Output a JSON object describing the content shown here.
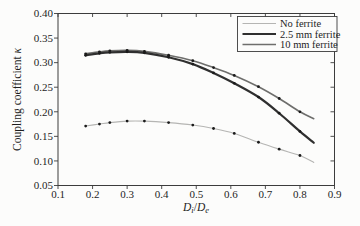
{
  "figure": {
    "background": "#fcfcfb",
    "axis_color": "#3c3c3c"
  },
  "chart_data": {
    "type": "line",
    "title": "",
    "xlabel": "Di/De",
    "ylabel": "Coupling coefficient κ",
    "xlabel_parts": {
      "D1": "D",
      "sub1": "i",
      "slash": "/",
      "D2": "D",
      "sub2": "e"
    },
    "ylabel_parts": {
      "text": "Coupling coefficient ",
      "kappa": "κ"
    },
    "xlim": [
      0.1,
      0.9
    ],
    "ylim": [
      0.05,
      0.4
    ],
    "grid": false,
    "legend_position": "top-right",
    "x_ticks": [
      {
        "v": 0.1,
        "label": "0.1"
      },
      {
        "v": 0.2,
        "label": "0.2"
      },
      {
        "v": 0.3,
        "label": "0.3"
      },
      {
        "v": 0.4,
        "label": "0.4"
      },
      {
        "v": 0.5,
        "label": "0.5"
      },
      {
        "v": 0.6,
        "label": "0.6"
      },
      {
        "v": 0.7,
        "label": "0.7"
      },
      {
        "v": 0.8,
        "label": "0.8"
      },
      {
        "v": 0.9,
        "label": "0.9"
      }
    ],
    "y_ticks": [
      {
        "v": 0.05,
        "label": "0.05"
      },
      {
        "v": 0.1,
        "label": "0.10"
      },
      {
        "v": 0.15,
        "label": "0.15"
      },
      {
        "v": 0.2,
        "label": "0.20"
      },
      {
        "v": 0.25,
        "label": "0.25"
      },
      {
        "v": 0.3,
        "label": "0.30"
      },
      {
        "v": 0.35,
        "label": "0.35"
      },
      {
        "v": 0.4,
        "label": "0.40"
      }
    ],
    "x": [
      0.18,
      0.22,
      0.25,
      0.3,
      0.35,
      0.42,
      0.49,
      0.55,
      0.61,
      0.68,
      0.74,
      0.8,
      0.84
    ],
    "series": [
      {
        "name": "No ferrite",
        "color": "#b5b5b3",
        "width": 1.1,
        "values": [
          0.171,
          0.175,
          0.178,
          0.181,
          0.181,
          0.178,
          0.173,
          0.166,
          0.156,
          0.138,
          0.124,
          0.111,
          0.097
        ]
      },
      {
        "name": "2.5 mm ferrite",
        "color": "#2f2f2f",
        "width": 2.2,
        "values": [
          0.315,
          0.319,
          0.321,
          0.322,
          0.32,
          0.311,
          0.297,
          0.279,
          0.258,
          0.23,
          0.197,
          0.16,
          0.137
        ]
      },
      {
        "name": "10 mm ferrite",
        "color": "#6e6e6c",
        "width": 1.6,
        "values": [
          0.318,
          0.322,
          0.324,
          0.325,
          0.323,
          0.315,
          0.304,
          0.29,
          0.274,
          0.251,
          0.227,
          0.2,
          0.186
        ]
      }
    ],
    "draw_order": [
      0,
      2,
      1
    ],
    "marker_color": "#1a1a1a",
    "marker_radius": 1.4,
    "marker_on_last_point": false
  }
}
